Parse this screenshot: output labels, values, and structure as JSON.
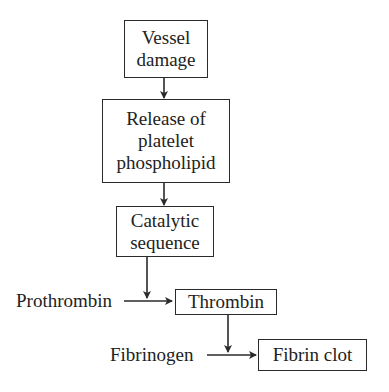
{
  "diagram": {
    "type": "flowchart",
    "nodes": {
      "vessel_damage": {
        "lines": [
          "Vessel",
          "damage"
        ]
      },
      "release_platelet": {
        "lines": [
          "Release of",
          "platelet",
          "phospholipid"
        ]
      },
      "catalytic_sequence": {
        "lines": [
          "Catalytic",
          "sequence"
        ]
      },
      "thrombin": {
        "lines": [
          "Thrombin"
        ]
      },
      "fibrin_clot": {
        "lines": [
          "Fibrin clot"
        ]
      }
    },
    "inputs": {
      "prothrombin": "Prothrombin",
      "fibrinogen": "Fibrinogen"
    },
    "edges": [
      {
        "from": "Vessel damage",
        "to": "Release of platelet phospholipid"
      },
      {
        "from": "Release of platelet phospholipid",
        "to": "Catalytic sequence"
      },
      {
        "from": "Catalytic sequence",
        "to": "Prothrombin → Thrombin conversion"
      },
      {
        "from": "Prothrombin",
        "to": "Thrombin"
      },
      {
        "from": "Thrombin",
        "to": "Fibrinogen → Fibrin clot conversion"
      },
      {
        "from": "Fibrinogen",
        "to": "Fibrin clot"
      }
    ],
    "colors": {
      "stroke": "#2a2a2a",
      "text": "#222222",
      "background": "#ffffff"
    }
  }
}
